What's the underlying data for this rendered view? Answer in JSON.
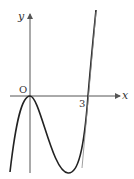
{
  "figure": {
    "type": "cubic function graph",
    "axes": {
      "x_label": "x",
      "y_label": "y",
      "origin_label": "O"
    },
    "tick_labels": {
      "x_intercept": "3"
    },
    "curve": {
      "description": "cubic with local maximum at origin (touching x-axis) and crossing x-axis at x=3",
      "roots": [
        0,
        3
      ],
      "local_max": [
        0,
        0
      ],
      "local_min_x": 2
    },
    "colors": {
      "axis": "#555555",
      "curve": "#222222",
      "text": "#333333"
    }
  }
}
